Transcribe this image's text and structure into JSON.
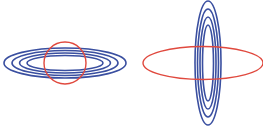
{
  "colors": {
    "background": "#ffffff",
    "contour": "#3a4fa0",
    "constraint": "#e0493e"
  },
  "panels": [
    {
      "name": "left-panel",
      "description": "Horizontally elongated concentric contour ellipses with circular constraint",
      "contours": [
        {
          "cx": 65,
          "cy": 63,
          "rx": 61,
          "ry": 15
        },
        {
          "cx": 65,
          "cy": 63,
          "rx": 53,
          "ry": 12.5
        },
        {
          "cx": 65,
          "cy": 63,
          "rx": 45.5,
          "ry": 10
        },
        {
          "cx": 65,
          "cy": 63,
          "rx": 38,
          "ry": 7.5
        }
      ],
      "constraint": {
        "cx": 65,
        "cy": 63,
        "rx": 21,
        "ry": 21
      }
    },
    {
      "name": "right-panel",
      "description": "Vertically elongated concentric contour ellipses with horizontal elliptical constraint",
      "contours": [
        {
          "cx": 208,
          "cy": 63,
          "rx": 13,
          "ry": 62
        },
        {
          "cx": 208,
          "cy": 63,
          "rx": 10.5,
          "ry": 54
        },
        {
          "cx": 208,
          "cy": 63,
          "rx": 8,
          "ry": 46
        },
        {
          "cx": 208,
          "cy": 63,
          "rx": 5.5,
          "ry": 38
        }
      ],
      "constraint": {
        "cx": 203,
        "cy": 63,
        "rx": 60,
        "ry": 16.5
      }
    }
  ]
}
